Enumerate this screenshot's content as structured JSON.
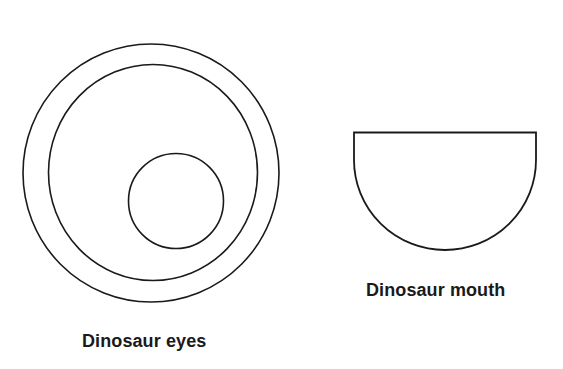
{
  "page": {
    "background_color": "#ffffff",
    "stroke_color": "#1a1a1a",
    "text_color": "#1a1a1a",
    "width": 563,
    "height": 369
  },
  "figures": {
    "eyes": {
      "caption": "Dinosaur eyes",
      "outline_shape": "concentric-circles",
      "outer_ring": {
        "cx": 151,
        "cy": 173,
        "rx": 128,
        "ry": 129,
        "stroke_width": 1.6
      },
      "middle_ring": {
        "cx": 153,
        "cy": 172.5,
        "rx": 104.5,
        "ry": 108,
        "stroke_width": 1.6
      },
      "pupil": {
        "cx": 176,
        "cy": 201,
        "rx": 47.5,
        "ry": 47.5,
        "stroke_width": 1.6
      }
    },
    "mouth": {
      "caption": "Dinosaur mouth",
      "outline_shape": "half-ellipse-bowl",
      "left": 354,
      "right": 536,
      "top": 132.5,
      "bottom": 250,
      "stroke_width": 1.8
    }
  }
}
